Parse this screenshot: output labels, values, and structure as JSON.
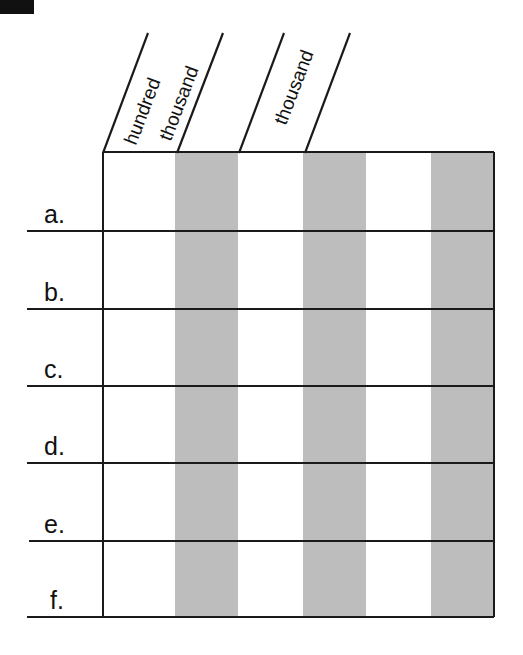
{
  "worksheet": {
    "column_headers": [
      {
        "label_line1": "hundred",
        "label_line2": "thousand"
      },
      {
        "label_line1": "thousand"
      }
    ],
    "rows": [
      "a.",
      "b.",
      "c.",
      "d.",
      "e.",
      "f."
    ],
    "colors": {
      "shaded_column": "#bdbdbd",
      "line": "#1a1a1a"
    }
  }
}
